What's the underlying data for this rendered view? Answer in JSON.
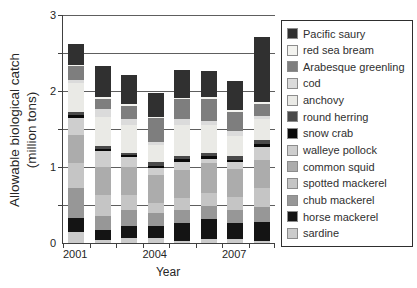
{
  "chart_data": {
    "type": "bar",
    "stacked": true,
    "title": "",
    "xlabel": "Year",
    "ylabel": "Allowable biological catch (million tons)",
    "ylabel_line1": "Allowable biological catch",
    "ylabel_line2": "(million tons)",
    "ylim": [
      0,
      3
    ],
    "y_ticks": [
      0,
      1,
      2,
      3
    ],
    "gridline_step": 0.5,
    "grid": true,
    "legend_position": "right",
    "categories": [
      "2001",
      "2002",
      "2003",
      "2004",
      "2005",
      "2006",
      "2007",
      "2008"
    ],
    "x_tick_labels": [
      {
        "label": "2001",
        "slot": 0
      },
      {
        "label": "2004",
        "slot": 3
      },
      {
        "label": "2007",
        "slot": 6
      }
    ],
    "series": [
      {
        "name": "Pacific saury",
        "color": "#303030",
        "values": [
          0.27,
          0.41,
          0.38,
          0.31,
          0.37,
          0.35,
          0.38,
          0.86
        ]
      },
      {
        "name": "red sea bream",
        "color": "#f3f3ef",
        "values": [
          0.02,
          0.02,
          0.02,
          0.01,
          0.02,
          0.02,
          0.02,
          0.02
        ]
      },
      {
        "name": "Arabesque greenling",
        "color": "#7e7e7e",
        "values": [
          0.19,
          0.14,
          0.18,
          0.32,
          0.26,
          0.29,
          0.26,
          0.16
        ]
      },
      {
        "name": "cod",
        "color": "#dbdbdb",
        "values": [
          0.04,
          0.1,
          0.08,
          0.04,
          0.08,
          0.06,
          0.06,
          0.04
        ]
      },
      {
        "name": "anchovy",
        "color": "#eaeae6",
        "values": [
          0.37,
          0.38,
          0.36,
          0.22,
          0.4,
          0.37,
          0.27,
          0.27
        ]
      },
      {
        "name": "round herring",
        "color": "#4a4a4a",
        "values": [
          0.04,
          0.04,
          0.03,
          0.05,
          0.04,
          0.04,
          0.05,
          0.06
        ]
      },
      {
        "name": "snow crab",
        "color": "#0a0a0a",
        "values": [
          0.04,
          0.03,
          0.03,
          0.03,
          0.04,
          0.03,
          0.03,
          0.04
        ]
      },
      {
        "name": "walleye pollock",
        "color": "#cecece",
        "values": [
          0.23,
          0.21,
          0.13,
          0.09,
          0.11,
          0.06,
          0.08,
          0.17
        ]
      },
      {
        "name": "common squid",
        "color": "#acacac",
        "values": [
          0.37,
          0.37,
          0.37,
          0.37,
          0.37,
          0.39,
          0.38,
          0.36
        ]
      },
      {
        "name": "spotted mackerel",
        "color": "#c5c5c5",
        "values": [
          0.32,
          0.28,
          0.19,
          0.13,
          0.16,
          0.17,
          0.16,
          0.25
        ]
      },
      {
        "name": "chub mackerel",
        "color": "#979797",
        "values": [
          0.4,
          0.18,
          0.22,
          0.18,
          0.17,
          0.18,
          0.18,
          0.2
        ]
      },
      {
        "name": "horse mackerel",
        "color": "#141414",
        "values": [
          0.18,
          0.13,
          0.15,
          0.16,
          0.23,
          0.26,
          0.21,
          0.26
        ]
      },
      {
        "name": "sardine",
        "color": "#cbcbcb",
        "values": [
          0.15,
          0.04,
          0.07,
          0.06,
          0.03,
          0.05,
          0.05,
          0.02
        ]
      }
    ]
  },
  "styles": {
    "background": "#ffffff",
    "text_color": "#262626",
    "axis_color": "#404040",
    "gridline_color": "#5e5e5e",
    "legend_border_color": "#2e2e2e",
    "swatch_border_color": "#8c8c8c"
  }
}
